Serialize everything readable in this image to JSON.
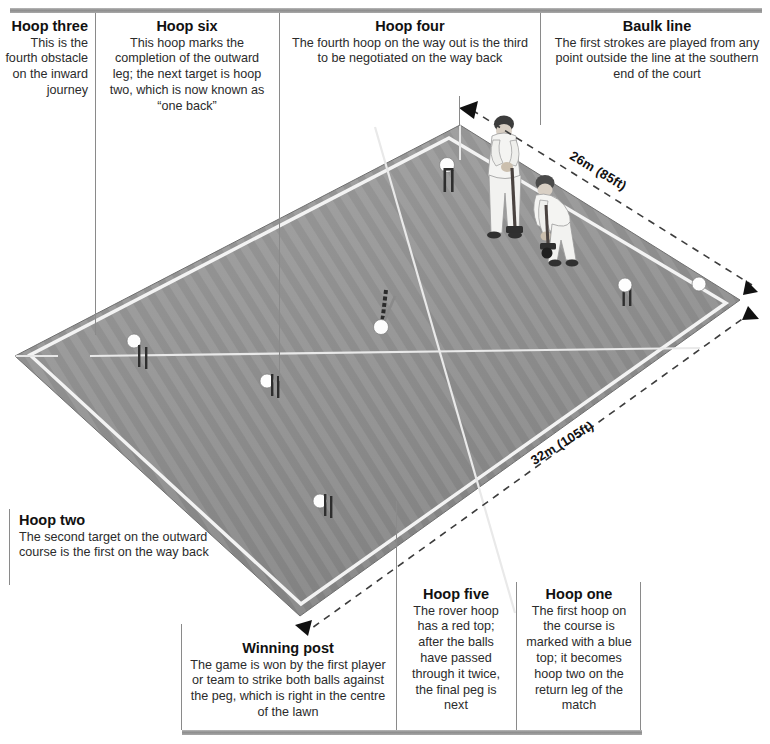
{
  "callouts": [
    {
      "id": "hoop-three",
      "title": "Hoop three",
      "text": "This is the fourth obstacle on the inward journey",
      "align": "right"
    },
    {
      "id": "hoop-six",
      "title": "Hoop six",
      "text": "This hoop marks the completion of the outward leg; the next target is hoop two, which is now known as “one back”",
      "align": "center"
    },
    {
      "id": "hoop-four",
      "title": "Hoop four",
      "text": "The fourth hoop on the way out is the third to be negotiated on the way back",
      "align": "right"
    },
    {
      "id": "baulk-line",
      "title": "Baulk line",
      "text": "The first strokes are played from any point outside the line at the southern end of the court",
      "align": "right"
    },
    {
      "id": "hoop-two",
      "title": "Hoop two",
      "text": "The second target on the outward course is the first on the way back",
      "align": "left"
    },
    {
      "id": "winning-post",
      "title": "Winning post",
      "text": "The game is won by the first player or team to strike both balls against the peg, which is right in the centre of the lawn",
      "align": "right"
    },
    {
      "id": "hoop-five",
      "title": "Hoop five",
      "text": "The rover hoop has a red top; after the balls have passed through it twice, the final peg is next",
      "align": "right"
    },
    {
      "id": "hoop-one",
      "title": "Hoop one",
      "text": "The first hoop on the course is marked with a blue top; it becomes hoop two on the return leg of the match",
      "align": "right"
    }
  ],
  "dimensions": [
    {
      "id": "width-26m",
      "label": "26m (85ft)"
    },
    {
      "id": "length-32m",
      "label": "32m (105ft)"
    }
  ],
  "court": {
    "surface_color": "#9a9a9a",
    "stripe_color": "#8d8d8d",
    "line_color": "#f2f2f2",
    "outline_color": "#6f6f6f",
    "dimension_line_color": "#4a4a4a",
    "hoops": [
      {
        "name": "hoop-marker-1"
      },
      {
        "name": "hoop-marker-2"
      },
      {
        "name": "hoop-marker-3"
      },
      {
        "name": "hoop-marker-4"
      },
      {
        "name": "hoop-marker-5"
      },
      {
        "name": "hoop-marker-6"
      }
    ],
    "peg": {
      "name": "centre-peg"
    },
    "players": [
      {
        "name": "player-standing"
      },
      {
        "name": "player-crouching"
      }
    ],
    "ball": {
      "name": "croquet-ball"
    }
  }
}
